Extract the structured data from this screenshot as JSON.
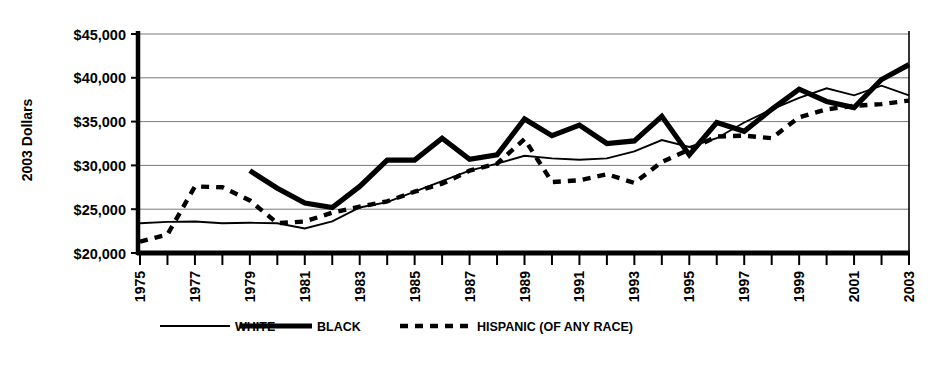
{
  "chart_data": {
    "type": "line",
    "title": "",
    "subtitle": "",
    "xlabel": "",
    "ylabel": "2003 Dollars",
    "ylim": [
      20000,
      45000
    ],
    "xlim": [
      1975,
      2003
    ],
    "grid": true,
    "y_ticks": [
      20000,
      25000,
      30000,
      35000,
      40000,
      45000
    ],
    "y_tick_labels": [
      "$20,000",
      "$25,000",
      "$30,000",
      "$35,000",
      "$40,000",
      "$45,000"
    ],
    "x_ticks": [
      1975,
      1976,
      1977,
      1978,
      1979,
      1980,
      1981,
      1982,
      1983,
      1984,
      1985,
      1986,
      1987,
      1988,
      1989,
      1990,
      1991,
      1992,
      1993,
      1994,
      1995,
      1996,
      1997,
      1998,
      1999,
      2000,
      2001,
      2002,
      2003
    ],
    "x_tick_labels": [
      "1975",
      "",
      "1977",
      "",
      "1979",
      "",
      "1981",
      "",
      "1983",
      "",
      "1985",
      "",
      "1987",
      "",
      "1989",
      "",
      "1991",
      "",
      "1993",
      "",
      "1995",
      "",
      "1997",
      "",
      "1999",
      "",
      "2001",
      "",
      "2003"
    ],
    "x_tick_labels_rotated": true,
    "legend_position": "bottom",
    "series": [
      {
        "name": "WHITE",
        "style": "solid-thin",
        "x": [
          1975,
          1976,
          1977,
          1978,
          1979,
          1980,
          1981,
          1982,
          1983,
          1984,
          1985,
          1986,
          1987,
          1988,
          1989,
          1990,
          1991,
          1992,
          1993,
          1994,
          1995,
          1996,
          1997,
          1998,
          1999,
          2000,
          2001,
          2002,
          2003
        ],
        "values": [
          23400,
          23550,
          23600,
          23400,
          23450,
          23400,
          22800,
          23600,
          25200,
          25800,
          27000,
          28200,
          29400,
          30200,
          31100,
          30800,
          30650,
          30800,
          31600,
          32900,
          32100,
          33100,
          34900,
          36400,
          37700,
          38800,
          38000,
          39100,
          38000
        ]
      },
      {
        "name": "BLACK",
        "style": "solid-thick",
        "x": [
          1979,
          1980,
          1981,
          1982,
          1983,
          1984,
          1985,
          1986,
          1987,
          1988,
          1989,
          1990,
          1991,
          1992,
          1993,
          1994,
          1995,
          1996,
          1997,
          1998,
          1999,
          2000,
          2001,
          2002,
          2003
        ],
        "values": [
          29400,
          27400,
          25700,
          25200,
          27600,
          30600,
          30600,
          33100,
          30700,
          31200,
          35300,
          33400,
          34600,
          32500,
          32800,
          35600,
          31200,
          34900,
          33900,
          36400,
          38700,
          37300,
          36600,
          39800,
          41500
        ]
      },
      {
        "name": "HISPANIC (OF ANY RACE)",
        "style": "dashed",
        "x": [
          1975,
          1976,
          1977,
          1978,
          1979,
          1980,
          1981,
          1982,
          1983,
          1984,
          1985,
          1986,
          1987,
          1988,
          1989,
          1990,
          1991,
          1992,
          1993,
          1994,
          1995,
          1996,
          1997,
          1998,
          1999,
          2000,
          2001,
          2002,
          2003
        ],
        "values": [
          21300,
          22100,
          27600,
          27500,
          26000,
          23400,
          23600,
          24600,
          25300,
          25900,
          27000,
          27900,
          29400,
          30200,
          33000,
          28100,
          28300,
          29000,
          28000,
          30400,
          31800,
          33300,
          33400,
          33100,
          35500,
          36400,
          36800,
          37000,
          37400
        ]
      }
    ],
    "legend": [
      {
        "label": "WHITE",
        "style": "solid-thin"
      },
      {
        "label": "BLACK",
        "style": "solid-thick"
      },
      {
        "label": "HISPANIC (OF ANY RACE)",
        "style": "dashed"
      }
    ],
    "colors": {
      "series": "#000000",
      "grid": "#6a6a6a",
      "axis": "#000000",
      "background": "#ffffff"
    }
  }
}
